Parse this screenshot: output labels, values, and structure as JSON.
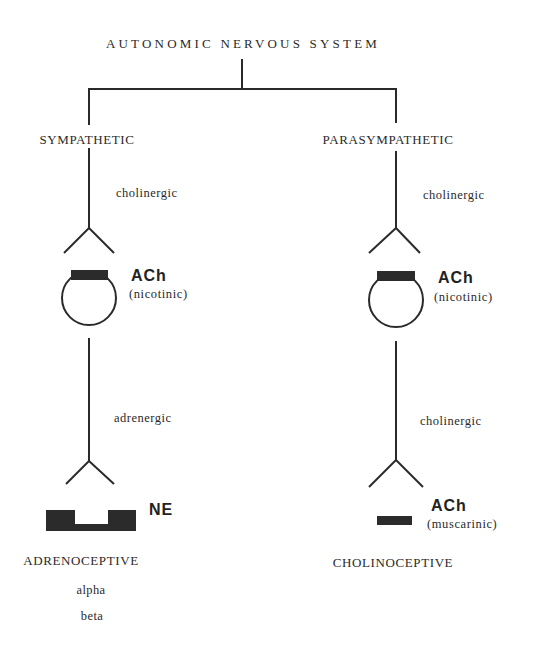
{
  "title": "AUTONOMIC NERVOUS SYSTEM",
  "branches": [
    {
      "name": "SYMPATHETIC",
      "preganglionic_fiber": "cholinergic",
      "ganglion_transmitter": "ACh",
      "ganglion_receptor": "(nicotinic)",
      "postganglionic_fiber": "adrenergic",
      "effector_transmitter": "NE",
      "effector_receptor": "",
      "receptor_class": "ADRENOCEPTIVE",
      "subtypes": [
        "alpha",
        "beta"
      ]
    },
    {
      "name": "PARASYMPATHETIC",
      "preganglionic_fiber": "cholinergic",
      "ganglion_transmitter": "ACh",
      "ganglion_receptor": "(nicotinic)",
      "postganglionic_fiber": "cholinergic",
      "effector_transmitter": "ACh",
      "effector_receptor": "(muscarinic)",
      "receptor_class": "CHOLINOCEPTIVE",
      "subtypes": []
    }
  ],
  "colors": {
    "ink": "#2a2a2a",
    "background": "#ffffff"
  }
}
